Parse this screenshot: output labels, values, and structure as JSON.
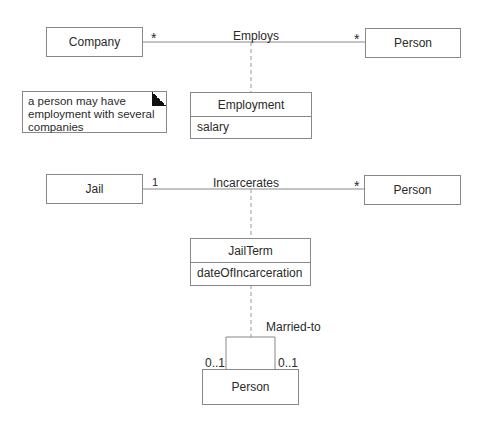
{
  "diagram": {
    "type": "UML class diagram - association classes",
    "section1": {
      "left_class": "Company",
      "right_class": "Person",
      "association": "Employs",
      "left_multiplicity": "*",
      "right_multiplicity": "*",
      "association_class": {
        "name": "Employment",
        "attributes": [
          "salary"
        ]
      },
      "note": {
        "lines": [
          "a person may have",
          "employment with several",
          "companies"
        ]
      }
    },
    "section2": {
      "left_class": "Jail",
      "right_class": "Person",
      "association": "Incarcerates",
      "left_multiplicity": "1",
      "right_multiplicity": "*",
      "association_class": {
        "name": "JailTerm",
        "attributes": [
          "dateOfIncarceration"
        ]
      }
    },
    "section3": {
      "class": "Person",
      "association": "Married-to",
      "left_multiplicity": "0..1",
      "right_multiplicity": "0..1"
    },
    "colors": {
      "line": "#888888",
      "text": "#2a2a2a",
      "background": "#ffffff"
    }
  }
}
